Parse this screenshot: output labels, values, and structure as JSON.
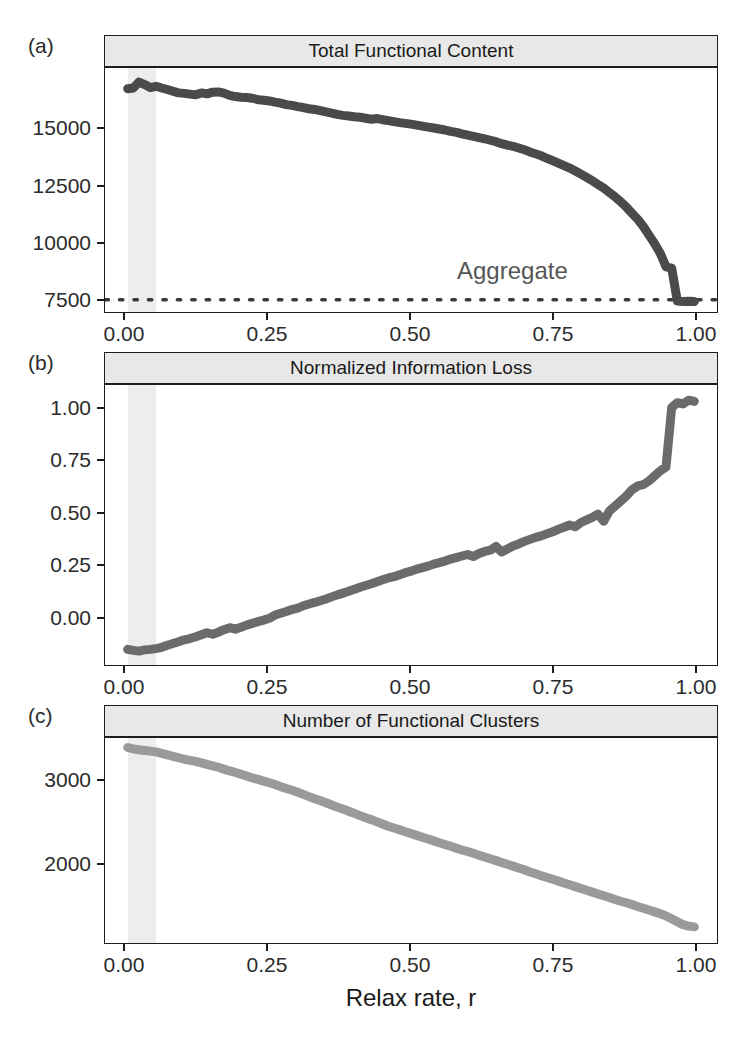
{
  "figure": {
    "panel_labels": [
      "(a)",
      "(b)",
      "(c)"
    ],
    "x_axis_title": "Relax rate, r",
    "annotation_aggregate": "Aggregate",
    "colors": {
      "trace_a": "#4a4a4a",
      "trace_b": "#6b6b6b",
      "trace_c": "#9a9a9a",
      "strip_fill": "#e8e8e8",
      "panel_border": "#1d1d1d",
      "highlight_band": "#ededed",
      "aggregate_line": "#3a3a3a"
    }
  },
  "chart_data": [
    {
      "type": "line",
      "panel": "(a)",
      "title": "Total Functional Content",
      "xlabel": "Relax rate, r",
      "ylabel": "",
      "xlim": [
        -0.04,
        1.04
      ],
      "ylim": [
        7000,
        17000
      ],
      "xticks": [
        0.0,
        0.25,
        0.5,
        0.75,
        1.0
      ],
      "xticklabels": [
        "0.00",
        "0.25",
        "0.50",
        "0.75",
        "1.00"
      ],
      "yticks": [
        7500,
        10000,
        12500,
        15000
      ],
      "yticklabels": [
        "7500",
        "10000",
        "12500",
        "15000"
      ],
      "grid": false,
      "legend": "none",
      "annotations": [
        {
          "text": "Aggregate",
          "x": 0.6,
          "y": 8800
        }
      ],
      "reference_lines": [
        {
          "style": "dotted",
          "orientation": "horizontal",
          "y": 7500,
          "label": "Aggregate"
        }
      ],
      "highlight_span": {
        "x0": 0.0,
        "x1": 0.05
      },
      "x": [
        0.0,
        0.01,
        0.02,
        0.03,
        0.04,
        0.05,
        0.06,
        0.07,
        0.08,
        0.09,
        0.1,
        0.11,
        0.12,
        0.13,
        0.14,
        0.15,
        0.16,
        0.17,
        0.18,
        0.19,
        0.2,
        0.21,
        0.22,
        0.23,
        0.24,
        0.25,
        0.26,
        0.27,
        0.28,
        0.29,
        0.3,
        0.31,
        0.32,
        0.33,
        0.34,
        0.35,
        0.36,
        0.37,
        0.38,
        0.39,
        0.4,
        0.41,
        0.42,
        0.43,
        0.44,
        0.45,
        0.46,
        0.47,
        0.48,
        0.49,
        0.5,
        0.51,
        0.52,
        0.53,
        0.54,
        0.55,
        0.56,
        0.57,
        0.58,
        0.59,
        0.6,
        0.61,
        0.62,
        0.63,
        0.64,
        0.65,
        0.66,
        0.67,
        0.68,
        0.69,
        0.7,
        0.71,
        0.72,
        0.73,
        0.74,
        0.75,
        0.76,
        0.77,
        0.78,
        0.79,
        0.8,
        0.81,
        0.82,
        0.83,
        0.84,
        0.85,
        0.86,
        0.87,
        0.88,
        0.89,
        0.9,
        0.91,
        0.92,
        0.93,
        0.94,
        0.95,
        0.96,
        0.97,
        0.98,
        0.99,
        1.0
      ],
      "values": [
        16150,
        16180,
        16420,
        16320,
        16200,
        16250,
        16180,
        16120,
        16050,
        15980,
        15960,
        15930,
        15900,
        15980,
        15940,
        16010,
        16020,
        15970,
        15880,
        15830,
        15800,
        15790,
        15760,
        15700,
        15680,
        15650,
        15600,
        15560,
        15500,
        15470,
        15420,
        15380,
        15330,
        15300,
        15250,
        15200,
        15150,
        15100,
        15060,
        15030,
        15000,
        14980,
        14940,
        14900,
        14930,
        14880,
        14840,
        14800,
        14760,
        14730,
        14700,
        14660,
        14620,
        14580,
        14540,
        14500,
        14460,
        14400,
        14360,
        14300,
        14250,
        14200,
        14150,
        14100,
        14040,
        13980,
        13900,
        13840,
        13790,
        13720,
        13650,
        13560,
        13480,
        13400,
        13300,
        13200,
        13100,
        13000,
        12900,
        12780,
        12650,
        12520,
        12380,
        12230,
        12080,
        11900,
        11720,
        11520,
        11300,
        11050,
        10800,
        10500,
        10150,
        9800,
        9400,
        8850,
        8800,
        7450,
        7430,
        7440,
        7430
      ]
    },
    {
      "type": "line",
      "panel": "(b)",
      "title": "Normalized Information Loss",
      "xlabel": "Relax rate, r",
      "ylabel": "",
      "xlim": [
        -0.04,
        1.04
      ],
      "ylim": [
        -0.05,
        1.06
      ],
      "xticks": [
        0.0,
        0.25,
        0.5,
        0.75,
        1.0
      ],
      "xticklabels": [
        "0.00",
        "0.25",
        "0.50",
        "0.75",
        "1.00"
      ],
      "yticks": [
        0.0,
        0.25,
        0.5,
        0.75,
        1.0
      ],
      "yticklabels": [
        "0.00",
        "0.25",
        "0.50",
        "0.75",
        "1.00"
      ],
      "grid": false,
      "legend": "none",
      "highlight_span": {
        "x0": 0.0,
        "x1": 0.05
      },
      "x": [
        0.0,
        0.01,
        0.02,
        0.03,
        0.04,
        0.05,
        0.06,
        0.07,
        0.08,
        0.09,
        0.1,
        0.11,
        0.12,
        0.13,
        0.14,
        0.15,
        0.16,
        0.17,
        0.18,
        0.19,
        0.2,
        0.21,
        0.22,
        0.23,
        0.24,
        0.25,
        0.26,
        0.27,
        0.28,
        0.29,
        0.3,
        0.31,
        0.32,
        0.33,
        0.34,
        0.35,
        0.36,
        0.37,
        0.38,
        0.39,
        0.4,
        0.41,
        0.42,
        0.43,
        0.44,
        0.45,
        0.46,
        0.47,
        0.48,
        0.49,
        0.5,
        0.51,
        0.52,
        0.53,
        0.54,
        0.55,
        0.56,
        0.57,
        0.58,
        0.59,
        0.6,
        0.61,
        0.62,
        0.63,
        0.64,
        0.65,
        0.66,
        0.67,
        0.68,
        0.69,
        0.7,
        0.71,
        0.72,
        0.73,
        0.74,
        0.75,
        0.76,
        0.77,
        0.78,
        0.79,
        0.8,
        0.81,
        0.82,
        0.83,
        0.84,
        0.85,
        0.86,
        0.87,
        0.88,
        0.89,
        0.9,
        0.91,
        0.92,
        0.93,
        0.94,
        0.95,
        0.96,
        0.97,
        0.98,
        0.99,
        1.0
      ],
      "values": [
        0.012,
        0.008,
        0.005,
        0.01,
        0.012,
        0.015,
        0.02,
        0.028,
        0.035,
        0.042,
        0.05,
        0.055,
        0.062,
        0.07,
        0.078,
        0.072,
        0.08,
        0.09,
        0.098,
        0.092,
        0.1,
        0.108,
        0.115,
        0.122,
        0.128,
        0.135,
        0.148,
        0.155,
        0.162,
        0.17,
        0.175,
        0.185,
        0.192,
        0.198,
        0.205,
        0.212,
        0.22,
        0.228,
        0.235,
        0.242,
        0.25,
        0.258,
        0.265,
        0.272,
        0.28,
        0.288,
        0.295,
        0.3,
        0.308,
        0.316,
        0.322,
        0.33,
        0.336,
        0.342,
        0.35,
        0.356,
        0.362,
        0.37,
        0.376,
        0.382,
        0.388,
        0.38,
        0.392,
        0.4,
        0.405,
        0.42,
        0.398,
        0.41,
        0.422,
        0.43,
        0.44,
        0.448,
        0.456,
        0.462,
        0.47,
        0.478,
        0.488,
        0.496,
        0.505,
        0.498,
        0.515,
        0.525,
        0.535,
        0.548,
        0.52,
        0.56,
        0.58,
        0.6,
        0.62,
        0.645,
        0.66,
        0.665,
        0.68,
        0.7,
        0.72,
        0.735,
        0.97,
        0.99,
        0.985,
        1.0,
        0.995
      ]
    },
    {
      "type": "line",
      "panel": "(c)",
      "title": "Number of Functional Clusters",
      "xlabel": "Relax rate, r",
      "ylabel": "",
      "xlim": [
        -0.04,
        1.04
      ],
      "ylim": [
        1050,
        3850
      ],
      "xticks": [
        0.0,
        0.25,
        0.5,
        0.75,
        1.0
      ],
      "xticklabels": [
        "0.00",
        "0.25",
        "0.50",
        "0.75",
        "1.00"
      ],
      "yticks": [
        2000,
        3000
      ],
      "yticklabels": [
        "2000",
        "3000"
      ],
      "grid": false,
      "legend": "none",
      "highlight_span": {
        "x0": 0.0,
        "x1": 0.05
      },
      "x": [
        0.0,
        0.01,
        0.02,
        0.03,
        0.04,
        0.05,
        0.06,
        0.07,
        0.08,
        0.09,
        0.1,
        0.11,
        0.12,
        0.13,
        0.14,
        0.15,
        0.16,
        0.17,
        0.18,
        0.19,
        0.2,
        0.21,
        0.22,
        0.23,
        0.24,
        0.25,
        0.26,
        0.27,
        0.28,
        0.29,
        0.3,
        0.31,
        0.32,
        0.33,
        0.34,
        0.35,
        0.36,
        0.37,
        0.38,
        0.39,
        0.4,
        0.41,
        0.42,
        0.43,
        0.44,
        0.45,
        0.46,
        0.47,
        0.48,
        0.49,
        0.5,
        0.51,
        0.52,
        0.53,
        0.54,
        0.55,
        0.56,
        0.57,
        0.58,
        0.59,
        0.6,
        0.61,
        0.62,
        0.63,
        0.64,
        0.65,
        0.66,
        0.67,
        0.68,
        0.69,
        0.7,
        0.71,
        0.72,
        0.73,
        0.74,
        0.75,
        0.76,
        0.77,
        0.78,
        0.79,
        0.8,
        0.81,
        0.82,
        0.83,
        0.84,
        0.85,
        0.86,
        0.87,
        0.88,
        0.89,
        0.9,
        0.91,
        0.92,
        0.93,
        0.94,
        0.95,
        0.96,
        0.97,
        0.98,
        0.99,
        1.0
      ],
      "values": [
        3720,
        3700,
        3690,
        3680,
        3670,
        3660,
        3640,
        3620,
        3600,
        3580,
        3560,
        3545,
        3530,
        3510,
        3490,
        3470,
        3450,
        3425,
        3400,
        3380,
        3355,
        3330,
        3305,
        3285,
        3260,
        3240,
        3215,
        3185,
        3160,
        3135,
        3110,
        3080,
        3050,
        3020,
        2995,
        2965,
        2935,
        2905,
        2880,
        2850,
        2820,
        2790,
        2760,
        2735,
        2705,
        2675,
        2645,
        2620,
        2595,
        2570,
        2545,
        2520,
        2495,
        2470,
        2445,
        2420,
        2395,
        2370,
        2345,
        2320,
        2300,
        2275,
        2250,
        2225,
        2200,
        2175,
        2150,
        2125,
        2100,
        2075,
        2050,
        2020,
        1995,
        1970,
        1945,
        1920,
        1895,
        1870,
        1845,
        1820,
        1795,
        1770,
        1745,
        1720,
        1695,
        1670,
        1645,
        1620,
        1600,
        1575,
        1550,
        1525,
        1500,
        1475,
        1450,
        1420,
        1380,
        1340,
        1300,
        1280,
        1270
      ]
    }
  ]
}
